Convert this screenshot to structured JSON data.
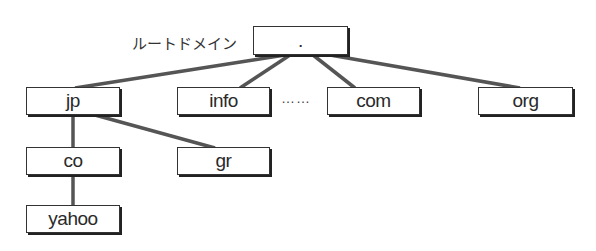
{
  "diagram": {
    "root_label": "ルートドメイン",
    "ellipsis": "……",
    "nodes": {
      "root": ".",
      "jp": "jp",
      "info": "info",
      "com": "com",
      "org": "org",
      "co": "co",
      "gr": "gr",
      "yahoo": "yahoo"
    },
    "edges": [
      [
        "root",
        "jp"
      ],
      [
        "root",
        "info"
      ],
      [
        "root",
        "com"
      ],
      [
        "root",
        "org"
      ],
      [
        "jp",
        "co"
      ],
      [
        "jp",
        "gr"
      ],
      [
        "co",
        "yahoo"
      ]
    ],
    "line_color": "#555555"
  }
}
